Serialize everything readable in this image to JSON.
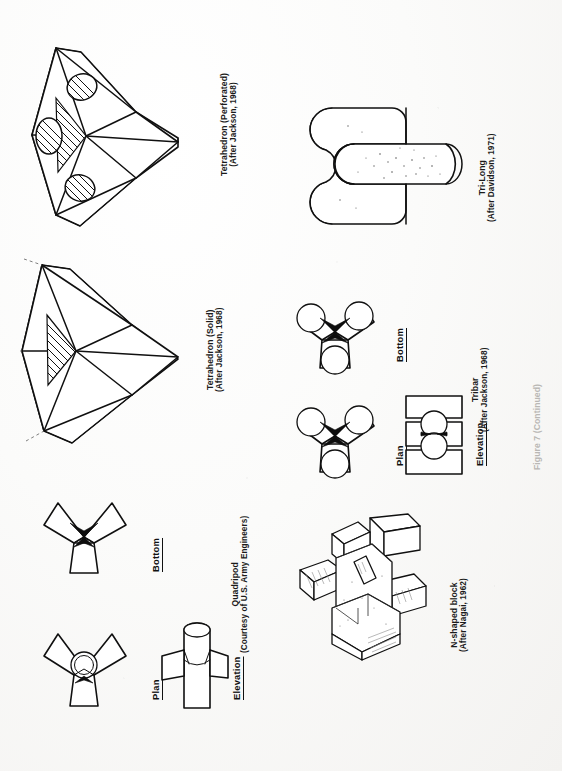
{
  "page": {
    "kind": "scanned-figure-page",
    "orientation": "landscape-text-rotated-90",
    "background_color": "#f7f6f4",
    "ink_color": "#101010"
  },
  "figures": [
    {
      "id": "tetrahedron-perforated",
      "title": "Tetrahedron (Perforated)",
      "credit": "(After Jackson, 1968)",
      "views": []
    },
    {
      "id": "tetrahedron-solid",
      "title": "Tetrahedron (Solid)",
      "credit": "(After Jackson, 1968)",
      "views": []
    },
    {
      "id": "quadripod",
      "title": "Quadripod",
      "credit": "(Courtesy of U.S. Army Engineers)",
      "views": [
        "Bottom",
        "Plan",
        "Elevation"
      ]
    },
    {
      "id": "tri-long",
      "title": "Tri-Long",
      "credit": "(After Davidson, 1971)",
      "views": []
    },
    {
      "id": "tribar",
      "title": "Tribar",
      "credit": "(After Jackson, 1968)",
      "views": [
        "Bottom",
        "Plan",
        "Elevation"
      ]
    },
    {
      "id": "n-shaped-block",
      "title": "N-shaped block",
      "credit": "(After Nagai, 1962)",
      "views": []
    }
  ],
  "view_labels": {
    "quadripod_bottom": "Bottom",
    "quadripod_plan": "Plan",
    "quadripod_elevation": "Elevation",
    "tribar_bottom": "Bottom",
    "tribar_plan": "Plan",
    "tribar_elevation": "Elevation"
  },
  "footer": {
    "figure_caption": "Figure 7 (Continued)"
  }
}
